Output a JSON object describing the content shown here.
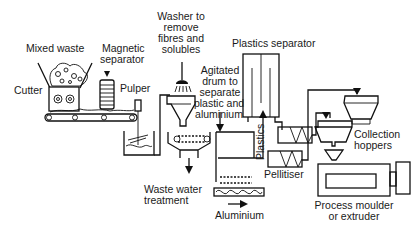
{
  "diagram": {
    "type": "process-flow",
    "labels": {
      "mixed_waste": "Mixed waste",
      "cutter": "Cutter",
      "magnetic_separator_1": "Magnetic",
      "magnetic_separator_2": "separator",
      "pulper": "Pulper",
      "washer_1": "Washer to",
      "washer_2": "remove",
      "washer_3": "fibres and",
      "washer_4": "solubles",
      "drum_1": "Agitated",
      "drum_2": "drum to",
      "drum_3": "separate",
      "drum_4": "plastic and",
      "drum_5": "aluminium",
      "plastics_separator": "Plastics separator",
      "plastics_flow": "Plastics",
      "pellitiser": "Pellitiser",
      "collection_1": "Collection",
      "collection_2": "hoppers",
      "waste_water_1": "Waste water",
      "waste_water_2": "treatment",
      "aluminium": "Aluminium",
      "moulder_1": "Process moulder",
      "moulder_2": "or extruder"
    },
    "nodes": [
      "Cutter",
      "Magnetic separator",
      "Pulper",
      "Washer",
      "Agitated drum",
      "Plastics separator",
      "Pellitiser",
      "Collection hoppers",
      "Process moulder or extruder"
    ],
    "outputs": [
      "Waste water treatment",
      "Aluminium"
    ]
  }
}
